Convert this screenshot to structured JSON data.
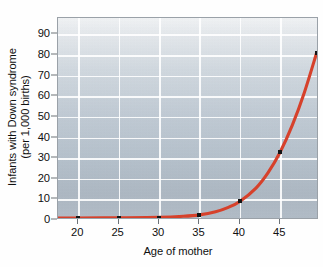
{
  "chart_data": {
    "type": "line",
    "title": "",
    "xlabel": "Age of mother",
    "ylabel_line1": "Infants with Down syndrome",
    "ylabel_line2": "(per 1,000 births)",
    "xlim": [
      17.5,
      49.8
    ],
    "ylim": [
      0,
      98
    ],
    "xticks": [
      20,
      25,
      30,
      35,
      40,
      45
    ],
    "xtick_labels": [
      "20",
      "25",
      "30",
      "35",
      "40",
      "45"
    ],
    "yticks": [
      0,
      10,
      20,
      30,
      40,
      50,
      60,
      70,
      80,
      90
    ],
    "ytick_labels": [
      "0",
      "10",
      "20",
      "30",
      "40",
      "50",
      "60",
      "70",
      "80",
      "90"
    ],
    "grid": true,
    "legend": "none",
    "series": [
      {
        "name": "Down syndrome rate by maternal age",
        "color": "#d6412b",
        "marker_color": "#141414",
        "x": [
          20,
          25,
          30,
          35,
          40,
          45,
          49.5
        ],
        "values": [
          1,
          1,
          1,
          2.5,
          9,
          33,
          81
        ]
      }
    ],
    "curve_points": [
      {
        "x": 17.6,
        "y": 1.0
      },
      {
        "x": 20,
        "y": 1.0
      },
      {
        "x": 25,
        "y": 1.1
      },
      {
        "x": 30,
        "y": 1.3
      },
      {
        "x": 33,
        "y": 1.8
      },
      {
        "x": 35,
        "y": 2.5
      },
      {
        "x": 37,
        "y": 4.0
      },
      {
        "x": 38.5,
        "y": 6.0
      },
      {
        "x": 40,
        "y": 9.0
      },
      {
        "x": 42,
        "y": 15.5
      },
      {
        "x": 43.5,
        "y": 23.0
      },
      {
        "x": 45,
        "y": 33.0
      },
      {
        "x": 46.5,
        "y": 46.0
      },
      {
        "x": 48,
        "y": 62.0
      },
      {
        "x": 49.5,
        "y": 81.0
      }
    ],
    "colors": {
      "line": "#d6412b",
      "marker": "#141414",
      "grid": "#ffffff",
      "plot_background_top": "#f3f5f7",
      "plot_background_bottom": "#b2bdc8",
      "axis": "#9aa1a8",
      "text": "#101010"
    }
  }
}
